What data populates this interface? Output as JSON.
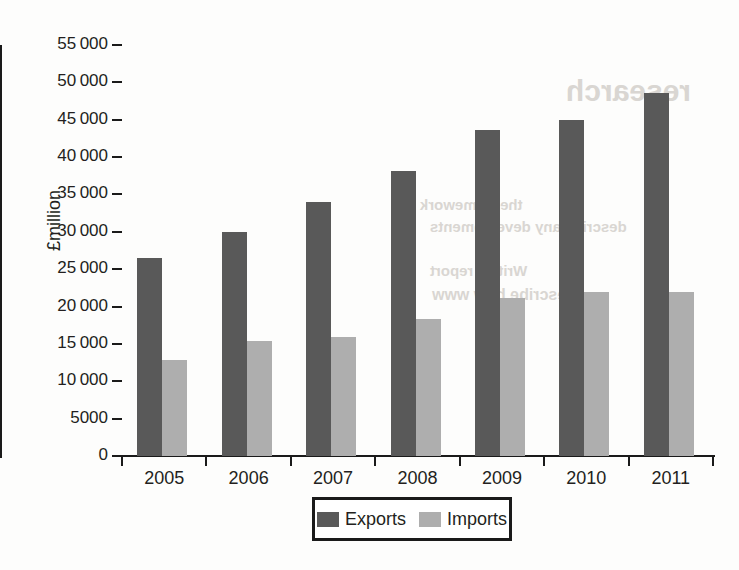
{
  "chart_data": {
    "type": "bar",
    "title": "",
    "subtitle": "",
    "xlabel": "",
    "ylabel": "£million",
    "categories": [
      "2005",
      "2006",
      "2007",
      "2008",
      "2009",
      "2010",
      "2011"
    ],
    "series": [
      {
        "name": "Exports",
        "color": "#595959",
        "values": [
          26500,
          30000,
          34000,
          38100,
          43600,
          45000,
          48600
        ]
      },
      {
        "name": "Imports",
        "color": "#aeaeae",
        "values": [
          12800,
          15400,
          15900,
          18400,
          21200,
          21900,
          21900
        ]
      }
    ],
    "ylim": [
      0,
      55000
    ],
    "ytick_values": [
      0,
      5000,
      10000,
      15000,
      20000,
      25000,
      30000,
      35000,
      40000,
      45000,
      50000,
      55000
    ],
    "ytick_labels": [
      "0",
      "5000",
      "10 000",
      "15 000",
      "20 000",
      "25 000",
      "30 000",
      "35 000",
      "40 000",
      "45 000",
      "50 000",
      "55 000"
    ],
    "grid": false,
    "legend_position": "bottom-center",
    "legend_entries": [
      "Exports",
      "Imports"
    ]
  },
  "legend": {
    "entries": [
      {
        "label": "Exports",
        "color": "#595959"
      },
      {
        "label": "Imports",
        "color": "#aeaeae"
      }
    ]
  },
  "axes": {
    "y_title": "£million"
  },
  "bleed_through": {
    "line1": "research",
    "line2": "the framework",
    "line3": "describe any developments",
    "line4": "Write a report",
    "line5": "Describe how www"
  }
}
